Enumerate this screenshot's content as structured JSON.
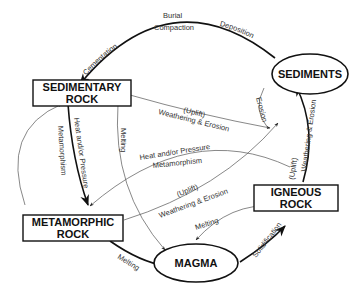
{
  "diagram": {
    "nodes": {
      "sediments": "SEDIMENTS",
      "sedimentary_1": "SEDIMENTARY",
      "sedimentary_2": "ROCK",
      "metamorphic_1": "METAMORPHIC",
      "metamorphic_2": "ROCK",
      "igneous_1": "IGNEOUS",
      "igneous_2": "ROCK",
      "magma": "MAGMA"
    },
    "edges": {
      "cementation": "Cementation",
      "burial": "Burial",
      "compaction": "Compaction",
      "deposition": "Deposition",
      "erosion": "Erosion",
      "uplift_1": "(Uplift)",
      "weathering_1": "Weathering & Erosion",
      "heat_pressure_1": "Heat and/or Pressure",
      "metamorphism_1": "Metamorphism",
      "melting_1": "Melting",
      "heat_pressure_2": "Heat and/or Pressure",
      "metamorphism_2": "Metamorphism",
      "uplift_2": "(Uplift)",
      "weathering_2": "Weathering & Erosion",
      "uplift_3": "(Uplift)",
      "weathering_3": "Weathering & Erosion",
      "melting_2": "Melting",
      "melting_3": "Melting",
      "solidification": "Solidification"
    }
  }
}
